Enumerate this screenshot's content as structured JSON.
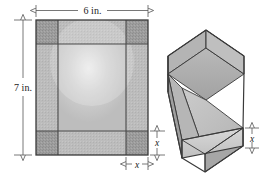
{
  "figure": {
    "type": "geometry-diagram",
    "sheet": {
      "width_label": "6 in.",
      "height_label": "7 in.",
      "cut_width_label": "x",
      "cut_height_label": "x",
      "width_value": 6,
      "height_value": 7,
      "units": "in.",
      "corner_cut_variable": "x"
    },
    "box": {
      "height_label": "x",
      "open_top": true,
      "base_width_expr": "6 - 2x",
      "base_length_expr": "7 - 2x",
      "height_expr": "x"
    },
    "colors": {
      "corner_fill": "#9a9a9a",
      "panel_fill": "#b8b8b8",
      "center_fill": "#d9d9d9",
      "outline": "#3a3a3a",
      "box_top_face": "#c9c9c9",
      "box_inner_face": "#b0b0b0",
      "box_front_face": "#cfcfcf",
      "box_side_face": "#a8a8a8",
      "dimension_line": "#555555",
      "text": "#1a1a1a"
    }
  }
}
